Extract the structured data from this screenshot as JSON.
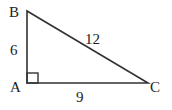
{
  "diagram": {
    "type": "right-triangle",
    "vertices": {
      "A": {
        "label": "A",
        "x": 27,
        "y": 83
      },
      "B": {
        "label": "B",
        "x": 27,
        "y": 11
      },
      "C": {
        "label": "C",
        "x": 148,
        "y": 83
      }
    },
    "sides": {
      "AB": {
        "label": "6"
      },
      "BC": {
        "label": "12"
      },
      "AC": {
        "label": "9"
      }
    },
    "right_angle_at": "A",
    "stroke_color": "#333333"
  }
}
